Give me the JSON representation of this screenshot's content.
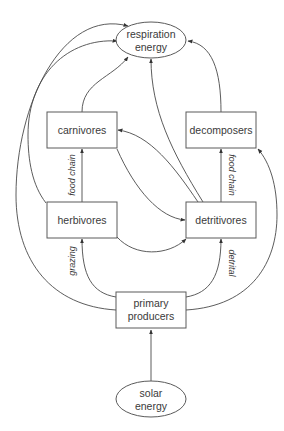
{
  "diagram": {
    "colors": {
      "background": "#ffffff",
      "stroke": "#4a4a4a",
      "text": "#3a3a3a"
    },
    "nodes": {
      "respiration": {
        "shape": "ellipse",
        "line1": "respiration",
        "line2": "energy"
      },
      "carnivores": {
        "shape": "box",
        "label": "carnivores"
      },
      "decomposers": {
        "shape": "box",
        "label": "decomposers"
      },
      "herbivores": {
        "shape": "box",
        "label": "herbivores"
      },
      "detritivores": {
        "shape": "box",
        "label": "detritivores"
      },
      "primary_producers": {
        "shape": "box",
        "line1": "primary",
        "line2": "producers"
      },
      "solar": {
        "shape": "ellipse",
        "line1": "solar",
        "line2": "energy"
      }
    },
    "edge_labels": {
      "food_chain_left": "food chain",
      "food_chain_right": "food chain",
      "grazing": "grazing",
      "detrital": "detrital"
    },
    "edges": [
      {
        "from": "solar energy",
        "to": "primary producers"
      },
      {
        "from": "primary producers",
        "to": "herbivores",
        "label": "grazing"
      },
      {
        "from": "primary producers",
        "to": "detritivores",
        "label": "detrital"
      },
      {
        "from": "primary producers",
        "to": "respiration energy"
      },
      {
        "from": "primary producers",
        "to": "decomposers"
      },
      {
        "from": "herbivores",
        "to": "respiration energy"
      },
      {
        "from": "herbivores",
        "to": "carnivores",
        "label": "food chain"
      },
      {
        "from": "herbivores",
        "to": "detritivores"
      },
      {
        "from": "carnivores",
        "to": "respiration energy"
      },
      {
        "from": "carnivores",
        "to": "detritivores"
      },
      {
        "from": "detritivores",
        "to": "carnivores"
      },
      {
        "from": "detritivores",
        "to": "respiration energy"
      },
      {
        "from": "detritivores",
        "to": "decomposers",
        "label": "food chain"
      },
      {
        "from": "decomposers",
        "to": "respiration energy"
      }
    ]
  }
}
